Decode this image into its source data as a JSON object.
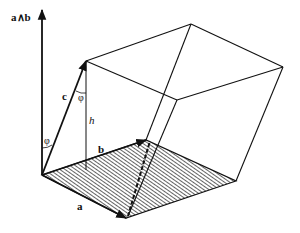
{
  "diagram": {
    "labels": {
      "wedge": "a∧b",
      "a": "a",
      "b": "b",
      "c": "c",
      "h": "h",
      "phi_top": "φ",
      "phi_bottom": "φ"
    },
    "vectors": [
      "a",
      "b",
      "c",
      "a∧b"
    ],
    "base_face": "hatched parallelogram spanned by a and b",
    "hidden_edge": "dashed",
    "colors": {
      "stroke": "#111111",
      "background": "#ffffff"
    }
  }
}
